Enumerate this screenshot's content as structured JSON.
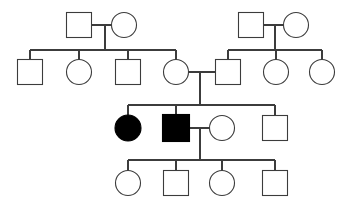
{
  "chart_data": {
    "type": "diagram",
    "diagram_kind": "pedigree",
    "generations": 4,
    "symbol_legend": {
      "square": "male",
      "circle": "female",
      "filled": "affected",
      "open": "unaffected"
    },
    "colors": {
      "line": "#3c3c3c",
      "affected_fill": "#000000",
      "unaffected_fill": "#ffffff",
      "background": "#ffffff"
    },
    "counts": {
      "total_individuals": 20,
      "affected_individuals": 2,
      "males": 10,
      "females": 10
    },
    "individuals": [
      {
        "id": "I-1",
        "generation": 1,
        "sex": "male",
        "status": "unaffected",
        "shape": "square",
        "cx": 79,
        "cy": 25,
        "size": 25
      },
      {
        "id": "I-2",
        "generation": 1,
        "sex": "female",
        "status": "unaffected",
        "shape": "circle",
        "cx": 124,
        "cy": 25,
        "size": 25
      },
      {
        "id": "I-3",
        "generation": 1,
        "sex": "male",
        "status": "unaffected",
        "shape": "square",
        "cx": 251,
        "cy": 25,
        "size": 25
      },
      {
        "id": "I-4",
        "generation": 1,
        "sex": "female",
        "status": "unaffected",
        "shape": "circle",
        "cx": 296,
        "cy": 25,
        "size": 25
      },
      {
        "id": "II-1",
        "generation": 2,
        "sex": "male",
        "status": "unaffected",
        "shape": "square",
        "cx": 30,
        "cy": 72,
        "size": 25
      },
      {
        "id": "II-2",
        "generation": 2,
        "sex": "female",
        "status": "unaffected",
        "shape": "circle",
        "cx": 79,
        "cy": 72,
        "size": 25
      },
      {
        "id": "II-3",
        "generation": 2,
        "sex": "male",
        "status": "unaffected",
        "shape": "square",
        "cx": 128,
        "cy": 72,
        "size": 25
      },
      {
        "id": "II-4",
        "generation": 2,
        "sex": "female",
        "status": "unaffected",
        "shape": "circle",
        "cx": 176,
        "cy": 72,
        "size": 25
      },
      {
        "id": "II-5",
        "generation": 2,
        "sex": "male",
        "status": "unaffected",
        "shape": "square",
        "cx": 228,
        "cy": 72,
        "size": 25
      },
      {
        "id": "II-6",
        "generation": 2,
        "sex": "female",
        "status": "unaffected",
        "shape": "circle",
        "cx": 276,
        "cy": 72,
        "size": 25
      },
      {
        "id": "II-7",
        "generation": 2,
        "sex": "female",
        "status": "unaffected",
        "shape": "circle",
        "cx": 322,
        "cy": 72,
        "size": 25
      },
      {
        "id": "III-1",
        "generation": 3,
        "sex": "female",
        "status": "affected",
        "shape": "circle",
        "cx": 128,
        "cy": 128,
        "size": 26
      },
      {
        "id": "III-2",
        "generation": 3,
        "sex": "male",
        "status": "affected",
        "shape": "square",
        "cx": 176,
        "cy": 128,
        "size": 27
      },
      {
        "id": "III-3",
        "generation": 3,
        "sex": "female",
        "status": "unaffected",
        "shape": "circle",
        "cx": 222,
        "cy": 128,
        "size": 25
      },
      {
        "id": "III-4",
        "generation": 3,
        "sex": "male",
        "status": "unaffected",
        "shape": "square",
        "cx": 275,
        "cy": 128,
        "size": 25
      },
      {
        "id": "IV-1",
        "generation": 4,
        "sex": "female",
        "status": "unaffected",
        "shape": "circle",
        "cx": 128,
        "cy": 183,
        "size": 25
      },
      {
        "id": "IV-2",
        "generation": 4,
        "sex": "male",
        "status": "unaffected",
        "shape": "square",
        "cx": 176,
        "cy": 183,
        "size": 25
      },
      {
        "id": "IV-3",
        "generation": 4,
        "sex": "female",
        "status": "unaffected",
        "shape": "circle",
        "cx": 222,
        "cy": 183,
        "size": 25
      },
      {
        "id": "IV-4",
        "generation": 4,
        "sex": "male",
        "status": "unaffected",
        "shape": "square",
        "cx": 275,
        "cy": 183,
        "size": 25
      }
    ],
    "unions": [
      {
        "id": "U1",
        "partners": [
          "I-1",
          "I-2"
        ],
        "marriage_y": 25,
        "descent_x": 105,
        "sibship_y": 50,
        "children": [
          "II-1",
          "II-2",
          "II-3",
          "II-4"
        ]
      },
      {
        "id": "U2",
        "partners": [
          "I-3",
          "I-4"
        ],
        "marriage_y": 25,
        "descent_x": 275,
        "sibship_y": 50,
        "children": [
          "II-5",
          "II-6",
          "II-7"
        ]
      },
      {
        "id": "U3",
        "partners": [
          "II-4",
          "II-5"
        ],
        "marriage_y": 72,
        "descent_x": 200,
        "sibship_y": 105,
        "children": [
          "III-1",
          "III-2",
          "III-4"
        ]
      },
      {
        "id": "U4",
        "partners": [
          "III-2",
          "III-3"
        ],
        "marriage_y": 128,
        "descent_x": 200,
        "sibship_y": 160,
        "children": [
          "IV-1",
          "IV-2",
          "IV-3",
          "IV-4"
        ]
      }
    ],
    "marriage_segments": [
      {
        "x1": 92,
        "x2": 112,
        "y": 25
      },
      {
        "x1": 264,
        "x2": 284,
        "y": 25
      },
      {
        "x1": 188,
        "x2": 216,
        "y": 72
      },
      {
        "x1": 190,
        "x2": 210,
        "y": 128
      }
    ],
    "sibship_bars": [
      {
        "y": 50,
        "x1": 30,
        "x2": 176
      },
      {
        "y": 50,
        "x1": 228,
        "x2": 322
      },
      {
        "y": 105,
        "x1": 128,
        "x2": 275
      },
      {
        "y": 160,
        "x1": 128,
        "x2": 275
      }
    ],
    "descent_drops": [
      {
        "x": 105,
        "y1": 25,
        "y2": 50
      },
      {
        "x": 275,
        "y1": 25,
        "y2": 50
      },
      {
        "x": 200,
        "y1": 72,
        "y2": 105
      },
      {
        "x": 200,
        "y1": 128,
        "y2": 160
      }
    ],
    "child_stems": [
      {
        "x": 30,
        "y1": 50,
        "y2": 60
      },
      {
        "x": 79,
        "y1": 50,
        "y2": 60
      },
      {
        "x": 128,
        "y1": 50,
        "y2": 60
      },
      {
        "x": 176,
        "y1": 50,
        "y2": 60
      },
      {
        "x": 228,
        "y1": 50,
        "y2": 60
      },
      {
        "x": 276,
        "y1": 50,
        "y2": 60
      },
      {
        "x": 322,
        "y1": 50,
        "y2": 60
      },
      {
        "x": 128,
        "y1": 105,
        "y2": 115
      },
      {
        "x": 176,
        "y1": 105,
        "y2": 115
      },
      {
        "x": 275,
        "y1": 105,
        "y2": 115
      },
      {
        "x": 128,
        "y1": 160,
        "y2": 171
      },
      {
        "x": 176,
        "y1": 160,
        "y2": 171
      },
      {
        "x": 222,
        "y1": 160,
        "y2": 171
      },
      {
        "x": 275,
        "y1": 160,
        "y2": 171
      }
    ]
  }
}
